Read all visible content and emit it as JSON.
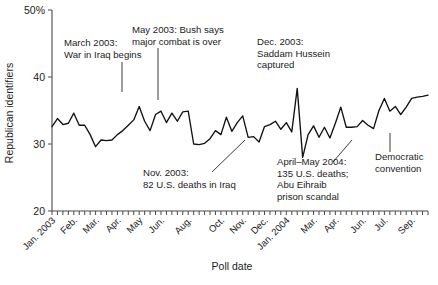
{
  "chart_data": {
    "type": "line",
    "title": "",
    "xlabel": "Poll date",
    "ylabel": "Republican identifiers",
    "ylim": [
      20,
      50
    ],
    "yticks": [
      20,
      30,
      40,
      50
    ],
    "ytick_labels": [
      "20",
      "30",
      "40",
      "50%"
    ],
    "grid": false,
    "legend": "none",
    "series_name": "Republican identifiers",
    "x_tick_labels": [
      "Jan. 2003",
      "Feb.",
      "Mar.",
      "Apr.",
      "May",
      "Jun.",
      "Aug.",
      "Oct.",
      "Nov.",
      "Dec.",
      "Jan. 2004",
      "Mar.",
      "Apr.",
      "Jun.",
      "Jul.",
      "Sep."
    ],
    "x_tick_positions": [
      0,
      4,
      8,
      12,
      16,
      20,
      25,
      31,
      35,
      39,
      43,
      48,
      52,
      57,
      61,
      66
    ],
    "n_points": 70,
    "values": [
      32.6,
      33.8,
      32.9,
      33.1,
      34.6,
      32.8,
      32.8,
      31.4,
      29.6,
      30.6,
      30.5,
      30.6,
      31.4,
      32.0,
      32.8,
      33.6,
      35.6,
      33.4,
      32.0,
      34.4,
      34.9,
      33.2,
      34.6,
      33.4,
      34.8,
      34.9,
      30.0,
      29.9,
      30.1,
      30.8,
      32.0,
      31.4,
      34.0,
      31.9,
      33.2,
      34.2,
      31.0,
      31.1,
      30.3,
      32.6,
      32.9,
      33.4,
      32.2,
      33.2,
      31.8,
      38.3,
      28.0,
      31.4,
      32.7,
      31.0,
      32.5,
      30.9,
      33.1,
      35.5,
      32.5,
      32.5,
      32.6,
      33.5,
      32.8,
      32.3,
      35.0,
      36.8,
      34.9,
      35.6,
      34.4,
      35.5,
      36.8,
      37.0,
      37.1,
      37.3
    ],
    "annotations": [
      {
        "id": "march-2003",
        "lines": [
          "March 2003:",
          "War in Iraq begins"
        ],
        "text_x": 64,
        "text_y": 46,
        "leader": {
          "x1": 122,
          "y1": 62,
          "x2": 122,
          "y2": 92
        }
      },
      {
        "id": "may-2003",
        "lines": [
          "May 2003: Bush says",
          "major combat is over"
        ],
        "text_x": 132,
        "text_y": 33,
        "leader": {
          "x1": 158,
          "y1": 48,
          "x2": 158,
          "y2": 100
        }
      },
      {
        "id": "dec-2003",
        "lines": [
          "Dec. 2003:",
          "Saddam Hussein",
          "captured"
        ],
        "text_x": 257,
        "text_y": 45,
        "leader": null
      },
      {
        "id": "nov-2003",
        "lines": [
          "Nov. 2003:",
          "82 U.S. deaths in Iraq"
        ],
        "text_x": 143,
        "text_y": 176,
        "leader": {
          "x1": 212,
          "y1": 172,
          "x2": 245,
          "y2": 140
        }
      },
      {
        "id": "april-may-2004",
        "lines": [
          "April–May 2004:",
          "135 U.S. deaths;",
          "Abu Eihraib",
          "prison scandal"
        ],
        "text_x": 277,
        "text_y": 165,
        "leader": {
          "x1": 333,
          "y1": 162,
          "x2": 352,
          "y2": 140
        }
      },
      {
        "id": "democratic-convention",
        "lines": [
          "Democratic",
          "convention"
        ],
        "text_x": 375,
        "text_y": 160,
        "leader": {
          "x1": 390,
          "y1": 133,
          "x2": 390,
          "y2": 152
        }
      }
    ]
  },
  "footer": {
    "partial_caption": ""
  }
}
